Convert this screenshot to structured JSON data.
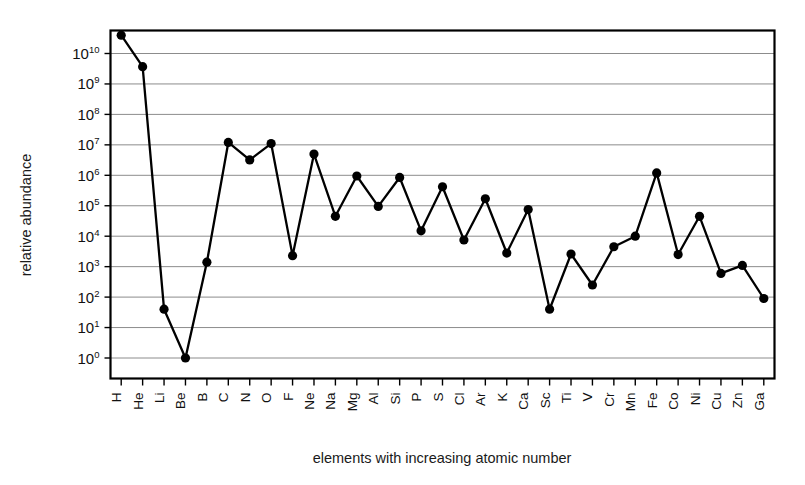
{
  "chart_data": {
    "type": "line",
    "title": "",
    "xlabel": "elements with increasing atomic number",
    "ylabel": "relative abundance",
    "yscale": "log",
    "ylim": [
      0.3,
      100000000000.0
    ],
    "grid": true,
    "legend": null,
    "markers": "filled-circle",
    "categories": [
      "H",
      "He",
      "Li",
      "Be",
      "B",
      "C",
      "N",
      "O",
      "F",
      "Ne",
      "Na",
      "Mg",
      "Al",
      "Si",
      "P",
      "S",
      "Cl",
      "Ar",
      "K",
      "Ca",
      "Sc",
      "Ti",
      "V",
      "Cr",
      "Mn",
      "Fe",
      "Co",
      "Ni",
      "Cu",
      "Zn",
      "Ga"
    ],
    "values": [
      40000000000.0,
      3700000000.0,
      40,
      1.0,
      1400,
      12000000.0,
      3200000.0,
      11000000.0,
      2300,
      5000000.0,
      45000.0,
      950000.0,
      95000.0,
      850000.0,
      15000.0,
      420000.0,
      7500.0,
      170000.0,
      2800.0,
      75000.0,
      40,
      2600.0,
      250,
      4500.0,
      10000.0,
      1200000.0,
      2500.0,
      45000.0,
      600,
      1100.0,
      90
    ],
    "ytick_labels": [
      "10⁰",
      "10¹",
      "10²",
      "10³",
      "10⁴",
      "10⁵",
      "10⁶",
      "10⁷",
      "10⁸",
      "10⁹",
      "10¹⁰"
    ],
    "yticks": [
      1,
      10,
      100,
      1000,
      10000,
      100000,
      1000000,
      10000000,
      100000000,
      1000000000,
      10000000000
    ],
    "ytick_mantissa": [
      "10",
      "10",
      "10",
      "10",
      "10",
      "10",
      "10",
      "10",
      "10",
      "10",
      "10"
    ],
    "ytick_exponent": [
      "0",
      "1",
      "2",
      "3",
      "4",
      "5",
      "6",
      "7",
      "8",
      "9",
      "10"
    ],
    "colors": {
      "line": "#000000",
      "marker": "#000000",
      "grid": "#8c8c8c",
      "axis": "#000000",
      "background": "#ffffff"
    }
  }
}
